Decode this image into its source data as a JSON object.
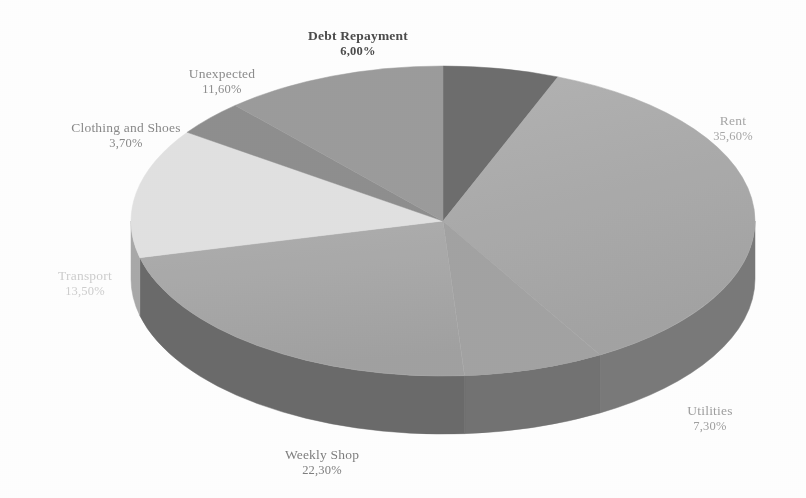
{
  "chart_data": {
    "type": "pie",
    "title": "",
    "subtitle": "",
    "xlabel": "",
    "ylabel": "",
    "legend_position": "none",
    "grid": false,
    "three_d": true,
    "value_suffix": "%",
    "decimal_separator": ",",
    "categories": [
      "Debt Repayment",
      "Rent",
      "Utilities",
      "Weekly Shop",
      "Transport",
      "Clothing and Shoes",
      "Unexpected"
    ],
    "values": [
      6.0,
      35.6,
      7.3,
      22.3,
      13.5,
      3.7,
      11.6
    ],
    "labels": [
      "6,00%",
      "35,60%",
      "7,30%",
      "22,30%",
      "13,50%",
      "3,70%",
      "11,60%"
    ],
    "colors": [
      "#6e6e6e",
      "#ababab",
      "#a3a3a3",
      "#ababab",
      "#e2e2e2",
      "#8f8f8f",
      "#9c9c9c"
    ],
    "slices": [
      {
        "name": "Debt Repayment",
        "value": 6.0,
        "label": "6,00%",
        "color": "#6e6e6e",
        "side_color": "#4f4f4f"
      },
      {
        "name": "Rent",
        "value": 35.6,
        "label": "35,60%",
        "color": "#ababab",
        "side_color": "#7a7a7a"
      },
      {
        "name": "Utilities",
        "value": 7.3,
        "label": "7,30%",
        "color": "#a3a3a3",
        "side_color": "#737373"
      },
      {
        "name": "Weekly Shop",
        "value": 22.3,
        "label": "22,30%",
        "color": "#ababab",
        "side_color": "#6b6b6b"
      },
      {
        "name": "Transport",
        "value": 13.5,
        "label": "13,50%",
        "color": "#e2e2e2",
        "side_color": "#a9a9a9"
      },
      {
        "name": "Clothing and Shoes",
        "value": 3.7,
        "label": "3,70%",
        "color": "#8f8f8f",
        "side_color": "#6a6a6a"
      },
      {
        "name": "Unexpected",
        "value": 11.6,
        "label": "11,60%",
        "color": "#9c9c9c",
        "side_color": "#767676"
      }
    ]
  },
  "labels": {
    "debt": {
      "name": "Debt Repayment",
      "value": "6,00%"
    },
    "unexpected": {
      "name": "Unexpected",
      "value": "11,60%"
    },
    "clothing": {
      "name": "Clothing and Shoes",
      "value": "3,70%"
    },
    "transport": {
      "name": "Transport",
      "value": "13,50%"
    },
    "weekly": {
      "name": "Weekly Shop",
      "value": "22,30%"
    },
    "utilities": {
      "name": "Utilities",
      "value": "7,30%"
    },
    "rent": {
      "name": "Rent",
      "value": "35,60%"
    }
  },
  "background_color": "#ffffff"
}
